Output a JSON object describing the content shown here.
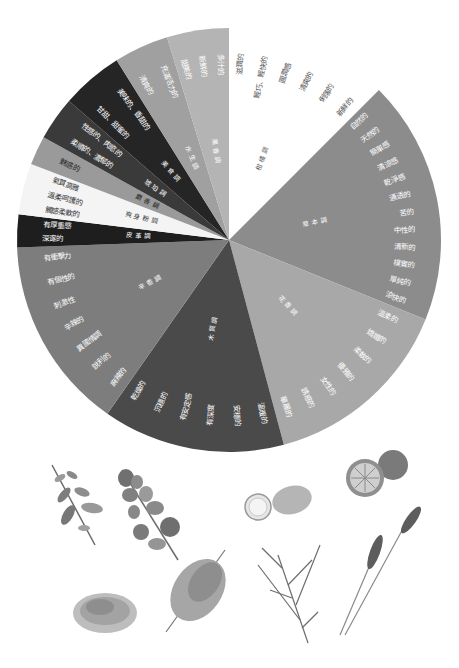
{
  "wheel": {
    "center": [
      229,
      240
    ],
    "radius": 212,
    "segments": [
      {
        "name": "柑橘調",
        "start": 0,
        "end": 45,
        "color": "#ffffff",
        "text_color": "#555555",
        "descriptors": [
          "滋潤的",
          "輕巧、輕快的",
          "圓潤感",
          "清爽的",
          "俐落的",
          "新鮮的"
        ]
      },
      {
        "name": "草本調",
        "start": 45,
        "end": 112,
        "color": "#8c8c8c",
        "text_color": "#ffffff",
        "descriptors": [
          "自然的",
          "天然的",
          "簡單感",
          "清涼感",
          "乾淨感",
          "通透的",
          "苦的",
          "中性的",
          "清新的",
          "樸實的",
          "單純的",
          "涼快的"
        ]
      },
      {
        "name": "花香調",
        "start": 112,
        "end": 165,
        "color": "#a8a8a8",
        "text_color": "#ffffff",
        "descriptors": [
          "溫柔的",
          "嬌媚的",
          "柔軟的",
          "優雅的",
          "女性的",
          "誘惑的",
          "華麗的"
        ]
      },
      {
        "name": "木質調",
        "start": 165,
        "end": 215,
        "color": "#4a4a4a",
        "text_color": "#ffffff",
        "descriptors": [
          "溫暖的",
          "安穩的",
          "有深度",
          "有安定感",
          "沉穩的",
          "乾燥的"
        ]
      },
      {
        "name": "辛香調",
        "start": 215,
        "end": 268,
        "color": "#7d7d7d",
        "text_color": "#ffffff",
        "descriptors": [
          "麻辣的",
          "銳利的",
          "異國情調",
          "辛辣的",
          "刺激性",
          "有個性的",
          "有衝擊力"
        ]
      },
      {
        "name": "皮革調",
        "start": 268,
        "end": 277,
        "color": "#1e1e1e",
        "text_color": "#ffffff",
        "descriptors": [
          "深邃的",
          "有厚重感"
        ]
      },
      {
        "name": "爽身粉調",
        "start": 277,
        "end": 291,
        "color": "#f4f4f4",
        "text_color": "#333333",
        "descriptors": [
          "觸感柔軟的",
          "溫柔呵護的",
          "氣質高雅"
        ]
      },
      {
        "name": "麝香調",
        "start": 291,
        "end": 299,
        "color": "#9a9a9a",
        "text_color": "#222222",
        "descriptors": [
          "魅惑的"
        ]
      },
      {
        "name": "琥珀調",
        "start": 299,
        "end": 311,
        "color": "#3a3a3a",
        "text_color": "#ffffff",
        "descriptors": [
          "柔順的、濃郁的",
          "性感的、肉慾的"
        ]
      },
      {
        "name": "美食調",
        "start": 311,
        "end": 328,
        "color": "#252525",
        "text_color": "#ffffff",
        "descriptors": [
          "甘甜、甜蜜的",
          "美味的、香甜的"
        ]
      },
      {
        "name": "水生調",
        "start": 328,
        "end": 343,
        "color": "#a0a0a0",
        "text_color": "#ffffff",
        "descriptors": [
          "清爽的",
          "充滿活力的"
        ]
      },
      {
        "name": "果香調",
        "start": 343,
        "end": 360,
        "color": "#b4b4b4",
        "text_color": "#ffffff",
        "descriptors": [
          "甜美的",
          "新鮮的",
          "多汁的"
        ]
      }
    ]
  },
  "illustrations": [
    {
      "name": "oregano-sprig",
      "x": 70,
      "y": 490
    },
    {
      "name": "eucalyptus-sprig",
      "x": 145,
      "y": 505
    },
    {
      "name": "lemon",
      "x": 270,
      "y": 495
    },
    {
      "name": "orange",
      "x": 370,
      "y": 468
    },
    {
      "name": "dried-herb-pile",
      "x": 100,
      "y": 610
    },
    {
      "name": "mimosa-branch",
      "x": 200,
      "y": 595
    },
    {
      "name": "rosemary-sprig",
      "x": 290,
      "y": 580
    },
    {
      "name": "lavender",
      "x": 380,
      "y": 580
    }
  ]
}
